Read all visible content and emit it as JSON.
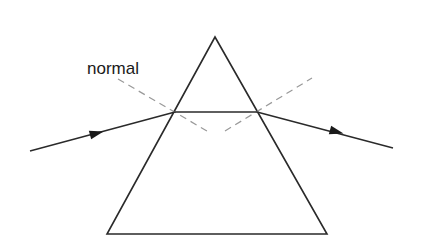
{
  "diagram": {
    "labels": {
      "normal": "normal"
    },
    "colors": {
      "background": "#ffffff",
      "line": "#2a2a2a",
      "normal_dash": "#999999",
      "text": "#1a1a1a"
    },
    "prism": {
      "apex": [
        215,
        37
      ],
      "base_left": [
        107,
        234
      ],
      "base_right": [
        327,
        234
      ]
    },
    "rays": {
      "incident": {
        "from": [
          30,
          151
        ],
        "to": [
          175,
          112
        ]
      },
      "inside": {
        "from": [
          175,
          112
        ],
        "to": [
          257,
          112
        ]
      },
      "emergent": {
        "from": [
          257,
          112
        ],
        "to": [
          393,
          148
        ]
      }
    },
    "normals": {
      "left": {
        "from": [
          118,
          79
        ],
        "to": [
          207,
          131
        ]
      },
      "right": {
        "from": [
          225,
          131
        ],
        "to": [
          312,
          78
        ]
      }
    },
    "arrows": [
      {
        "name": "incident-arrow",
        "at": [
          97,
          133
        ],
        "angle_deg": -15
      },
      {
        "name": "emergent-arrow",
        "at": [
          337,
          133
        ],
        "angle_deg": 15
      }
    ]
  }
}
